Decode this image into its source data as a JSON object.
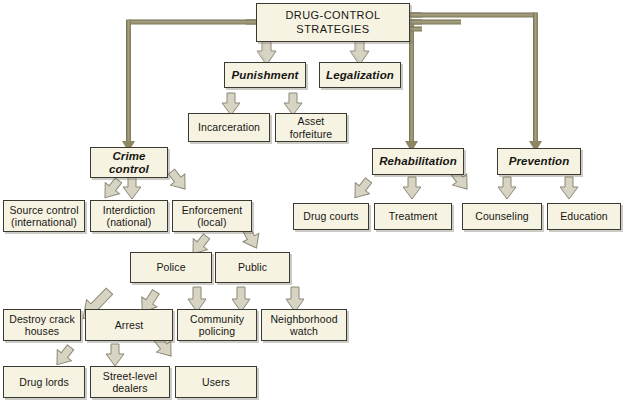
{
  "title": "DRUG-CONTROL STRATEGIES",
  "colors": {
    "box_fill": "#f6f3e2",
    "box_border": "#3a3a33",
    "box_shadow": "#787668",
    "connector": "#8d8662",
    "arrow_fill": "#d8d4c4",
    "arrow_border": "#8c8874",
    "background": "#ffffff",
    "text": "#161512"
  },
  "nodes": {
    "root": {
      "label": "DRUG-CONTROL\nSTRATEGIES"
    },
    "level1": [
      {
        "id": "crime-control",
        "label": "Crime\ncontrol"
      },
      {
        "id": "punishment",
        "label": "Punishment"
      },
      {
        "id": "legalization",
        "label": "Legalization"
      },
      {
        "id": "rehabilitation",
        "label": "Rehabilitation"
      },
      {
        "id": "prevention",
        "label": "Prevention"
      }
    ],
    "punishment_children": [
      {
        "id": "incarceration",
        "label": "Incarceration"
      },
      {
        "id": "asset-forfeiture",
        "label": "Asset\nforfeiture"
      }
    ],
    "crime_children": [
      {
        "id": "source-control",
        "label": "Source control\n(international)"
      },
      {
        "id": "interdiction",
        "label": "Interdiction\n(national)"
      },
      {
        "id": "enforcement",
        "label": "Enforcement\n(local)"
      }
    ],
    "rehabilitation_children": [
      {
        "id": "drug-courts",
        "label": "Drug courts"
      },
      {
        "id": "treatment",
        "label": "Treatment"
      },
      {
        "id": "counseling",
        "label": "Counseling"
      }
    ],
    "prevention_children": [
      {
        "id": "counseling-prev",
        "label": "Counseling"
      },
      {
        "id": "education",
        "label": "Education"
      }
    ],
    "enforcement_children": [
      {
        "id": "police",
        "label": "Police"
      },
      {
        "id": "public",
        "label": "Public"
      }
    ],
    "police_children": [
      {
        "id": "destroy-crack-houses",
        "label": "Destroy crack\nhouses"
      },
      {
        "id": "arrest",
        "label": "Arrest"
      }
    ],
    "public_children": [
      {
        "id": "community-policing",
        "label": "Community\npolicing"
      },
      {
        "id": "neighborhood-watch",
        "label": "Neighborhood\nwatch"
      }
    ],
    "arrest_children": [
      {
        "id": "drug-lords",
        "label": "Drug lords"
      },
      {
        "id": "street-level-dealers",
        "label": "Street-level\ndealers"
      },
      {
        "id": "users",
        "label": "Users"
      }
    ]
  }
}
